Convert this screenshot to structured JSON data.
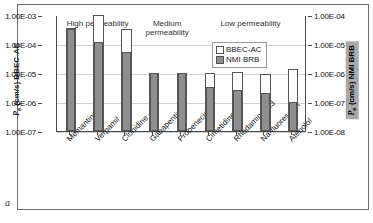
{
  "panel": {
    "letter": "a"
  },
  "chart_data": {
    "type": "bar",
    "title": "",
    "xlabel": "",
    "categories": [
      "Memantine",
      "Verpamil",
      "Clonidine",
      "Gabapentin",
      "Probenecid",
      "Cimetidine",
      "Rhodamine123",
      "Na-fluorescein",
      "Atenolol"
    ],
    "series": [
      {
        "name": "BBEC-AC",
        "axis": "left",
        "style": "open",
        "values": [
          0.00035,
          0.001,
          0.00032,
          1e-05,
          1e-05,
          1e-05,
          1.1e-05,
          9e-06,
          1.4e-05
        ]
      },
      {
        "name": "NMI BRB",
        "axis": "right",
        "style": "filled",
        "values": [
          3.2e-05,
          1.2e-05,
          5.5e-06,
          1e-06,
          1e-06,
          3.2e-07,
          2.5e-07,
          2e-07,
          1e-07
        ]
      }
    ],
    "y_axis_left": {
      "label": "Pe (cm/s) BBEC-AC",
      "label_main": " (cm/s) BBEC-AC",
      "label_symbol": "P",
      "label_sub": "e",
      "scale": "log",
      "ylim": [
        1e-07,
        0.001
      ],
      "ticks": [
        "1.00E-03",
        "1.00E-04",
        "1.00E-05",
        "1.00E-06",
        "1.00E-07"
      ]
    },
    "y_axis_right": {
      "label": "Pe (cm/s) NMI BRB",
      "label_main": " (cm/s) NMI BRB",
      "label_symbol": "P",
      "label_sub": "e",
      "scale": "log",
      "ylim": [
        1e-08,
        0.0001
      ],
      "ticks": [
        "1.00E-04",
        "1.00E-05",
        "1.00E-06",
        "1.00E-07",
        "1.00E-08"
      ]
    },
    "grid": true,
    "legend": {
      "position": "inside-top-right",
      "entries": [
        {
          "label": "BBEC-AC",
          "swatch": "open"
        },
        {
          "label": "NMI BRB",
          "swatch": "filled"
        }
      ]
    },
    "annotations": [
      {
        "text": "High permeability",
        "span": [
          0,
          2
        ]
      },
      {
        "text": "Medium\npermeability",
        "span": [
          3,
          4
        ]
      },
      {
        "text": "Low permeability",
        "span": [
          5,
          8
        ]
      }
    ],
    "colors": {
      "open_bar_fill": "#fdfdfd",
      "filled_bar_fill": "#8e8e8e",
      "bar_edge": "#555555",
      "grid": "#d2d2d2",
      "axis": "#4a4a4a",
      "right_title_bg": "#a9a9a9"
    }
  }
}
